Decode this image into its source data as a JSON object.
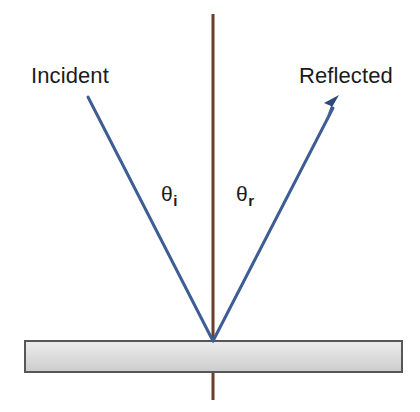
{
  "diagram": {
    "background_color": "#ffffff",
    "labels": {
      "incident": "Incident",
      "reflected": "Reflected",
      "theta_symbol": "θ",
      "theta_incident_sub": "i",
      "theta_reflected_sub": "r"
    },
    "colors": {
      "ray": "#3d5d94",
      "ray_dark": "#2f4a7a",
      "normal": "#6b3f2a",
      "surface_fill_top": "#e8e8e8",
      "surface_fill_bottom": "#cfcfcf",
      "surface_border": "#575757",
      "text": "#1b1b1b"
    },
    "geometry": {
      "incidence_point": {
        "x": 213,
        "y": 341
      },
      "normal_line": {
        "x": 213,
        "y_top": 14,
        "y_bottom": 400,
        "width": 3
      },
      "incident_ray": {
        "x1": 88,
        "y1": 97,
        "x2": 213,
        "y2": 341,
        "has_arrowhead": false
      },
      "reflected_ray": {
        "x1": 213,
        "y1": 341,
        "x2": 338,
        "y2": 98,
        "has_arrowhead": true
      },
      "surface_slab": {
        "x": 25,
        "y": 341,
        "width": 377,
        "height": 31
      }
    }
  }
}
